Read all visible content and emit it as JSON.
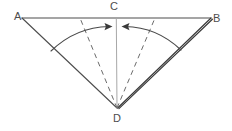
{
  "figure": {
    "background_color": "#ffffff",
    "line_color": "#4d4d4d",
    "dashed_color": "#6b6b6b",
    "center_line_color": "#a8a8a8",
    "arc_color": "#4a4a4a",
    "emphasis_color": "#3a3a3a"
  },
  "labels": {
    "a": "A",
    "b": "B",
    "c": "C",
    "d": "D"
  },
  "points": {
    "A": {
      "x": 22,
      "y": 18
    },
    "B": {
      "x": 211,
      "y": 18
    },
    "C": {
      "x": 116,
      "y": 18
    },
    "D": {
      "x": 117,
      "y": 108
    }
  },
  "edges": [
    {
      "name": "segment-ab",
      "from": "A",
      "to": "B",
      "style": "solid"
    },
    {
      "name": "segment-ad",
      "from": "A",
      "to": "D",
      "style": "solid"
    },
    {
      "name": "segment-bd",
      "from": "B",
      "to": "D",
      "style": "solid-double"
    },
    {
      "name": "segment-cd",
      "from": "C",
      "to": "D",
      "style": "solid-light"
    }
  ],
  "dashed_rays": [
    {
      "name": "dashed-ray-left",
      "from": "D",
      "to_x": 80,
      "to_y": 18
    },
    {
      "name": "dashed-ray-right",
      "from": "D",
      "to_x": 155,
      "to_y": 18
    }
  ],
  "arrows": [
    {
      "name": "arc-arrow-left",
      "direction": "right",
      "tip_x": 110,
      "tip_y": 27
    },
    {
      "name": "arc-arrow-right",
      "direction": "left",
      "tip_x": 123,
      "tip_y": 27
    }
  ],
  "arcs": [
    {
      "name": "sweep-arc-left",
      "start_x": 51,
      "start_y": 51,
      "end_x": 110,
      "end_y": 27
    },
    {
      "name": "sweep-arc-right",
      "start_x": 181,
      "start_y": 50,
      "end_x": 123,
      "end_y": 27
    }
  ]
}
